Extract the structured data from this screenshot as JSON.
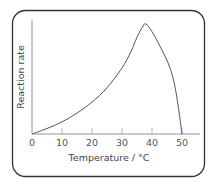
{
  "chart_data": {
    "type": "line",
    "title": "",
    "xlabel": "Temperature / °C",
    "ylabel": "Reaction rate",
    "xlim": [
      0,
      56
    ],
    "ylim": [
      0,
      1
    ],
    "xticks": [
      "0",
      "10",
      "20",
      "30",
      "40",
      "50"
    ],
    "xtick_values": [
      0,
      10,
      20,
      30,
      40,
      50
    ],
    "yticks": [],
    "grid": false,
    "legend": "none",
    "series": [
      {
        "name": "Reaction rate",
        "x": [
          0,
          5,
          10,
          15,
          20,
          25,
          30,
          33,
          35,
          37,
          38,
          40,
          43,
          46,
          48,
          50
        ],
        "y": [
          0,
          0.05,
          0.11,
          0.19,
          0.29,
          0.42,
          0.6,
          0.75,
          0.88,
          0.98,
          1.0,
          0.93,
          0.78,
          0.6,
          0.38,
          0
        ]
      }
    ],
    "line_color": "#555555"
  }
}
